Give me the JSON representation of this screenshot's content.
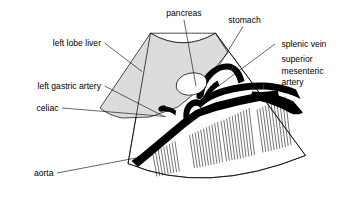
{
  "figure": {
    "type": "medical-illustration",
    "background_color": "#ffffff",
    "line_color": "#000000",
    "organ_fill_color": "#dcdcdc",
    "vessel_fill_color": "#000000"
  },
  "labels": {
    "pancreas": "pancreas",
    "stomach": "stomach",
    "splenic_vein": "splenic vein",
    "superior_line1": "superior",
    "superior_line2": "mesenteric",
    "superior_line3": "artery",
    "left_lobe_liver": "left lobe liver",
    "left_gastric_artery": "left gastric artery",
    "celiac": "celiac",
    "aorta": "aorta"
  },
  "structures": [
    {
      "name": "sector-fan",
      "label": null,
      "fill": "#ffffff"
    },
    {
      "name": "left-lobe-liver-region",
      "label": "left lobe liver",
      "fill": "#dcdcdc"
    },
    {
      "name": "pancreas-oval",
      "label": "pancreas",
      "fill": "#ffffff"
    },
    {
      "name": "splenic-vein-dot",
      "label": "splenic vein",
      "fill": "#000000"
    },
    {
      "name": "stomach-vessel",
      "label": "stomach",
      "fill": "#000000"
    },
    {
      "name": "aorta-vessel",
      "label": "aorta",
      "fill": "#000000"
    },
    {
      "name": "celiac-trunk",
      "label": "celiac",
      "fill": "#000000"
    },
    {
      "name": "superior-mesenteric-artery",
      "label": "superior mesenteric artery",
      "fill": "#000000"
    },
    {
      "name": "acoustic-shadow-bands",
      "label": null,
      "count": 4
    }
  ],
  "shadow_bands": [
    {
      "index": 1,
      "lines": 9
    },
    {
      "index": 2,
      "lines": 11
    },
    {
      "index": 3,
      "lines": 11
    },
    {
      "index": 4,
      "lines": 11
    }
  ]
}
